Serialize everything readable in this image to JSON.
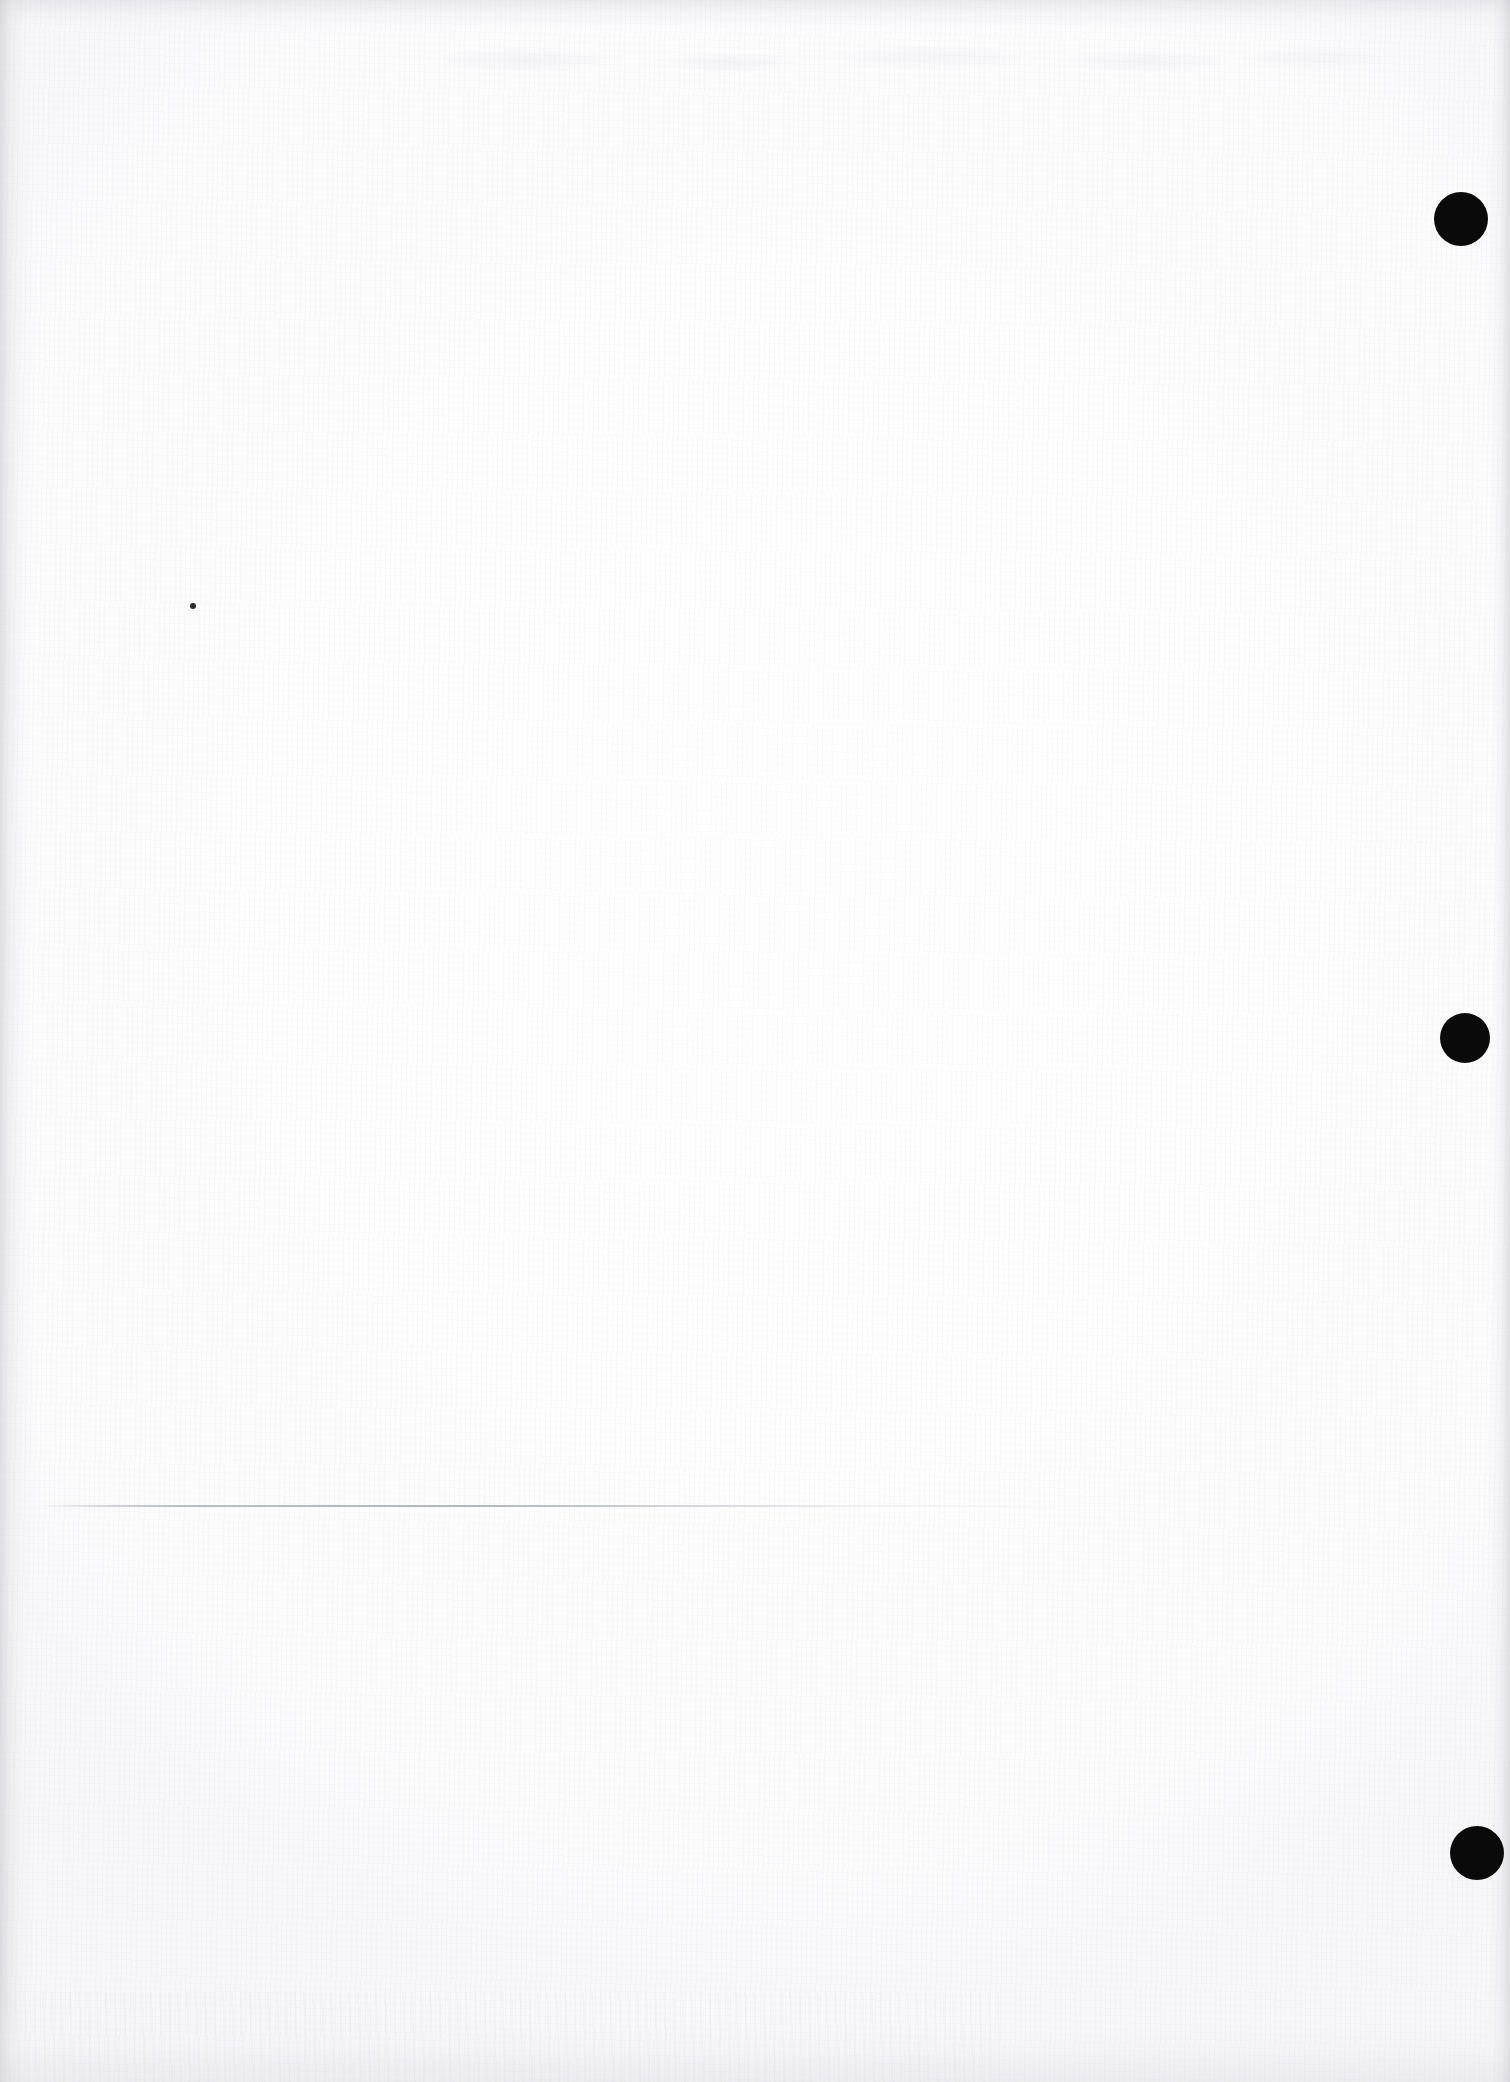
{
  "page": {
    "kind": "scanned-blank-page",
    "width": 1510,
    "height": 2082,
    "background_color": "#fdfdfd",
    "paper_tone": "#fefefe",
    "visible_text": ""
  },
  "marks": {
    "registration_dots": [
      {
        "label": "registration-dot-top",
        "cx": 1461,
        "cy": 219,
        "r": 27,
        "color": "#0a0a0a"
      },
      {
        "label": "registration-dot-middle",
        "cx": 1465,
        "cy": 1038,
        "r": 25,
        "color": "#0a0a0a"
      },
      {
        "label": "registration-dot-bottom",
        "cx": 1477,
        "cy": 1853,
        "r": 27,
        "color": "#0a0a0a"
      }
    ],
    "rule": {
      "label": "faint-horizontal-rule",
      "x": 40,
      "y": 1505,
      "width": 1150,
      "color": "#a8abb6"
    },
    "speck": {
      "label": "ink-speck",
      "cx": 193,
      "cy": 606,
      "r": 3,
      "color": "#2b2b30"
    }
  },
  "edges": {
    "left_shadow_color": "#c4c4ca",
    "top_shadow_color": "#cecece",
    "right_shadow_color": "#babac2",
    "bottom_shadow_color": "#d6d6dc"
  }
}
